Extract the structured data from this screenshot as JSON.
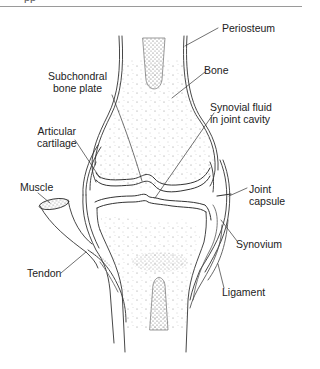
{
  "header": {
    "cut_text": "pp"
  },
  "diagram": {
    "labels": {
      "periosteum": "Periosteum",
      "bone": "Bone",
      "subchondral": "Subchondral\nbone plate",
      "synovial_fluid": "Synovial fluid\nin joint cavity",
      "articular": "Articular\ncartilage",
      "muscle": "Muscle",
      "joint_capsule": "Joint\ncapsule",
      "synovium": "Synovium",
      "tendon": "Tendon",
      "ligament": "Ligament"
    }
  }
}
